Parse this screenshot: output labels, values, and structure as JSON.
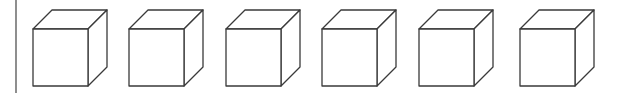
{
  "figure": {
    "divider": {
      "x": 16,
      "y1": 0,
      "y2": 93,
      "color": "#444444"
    },
    "stroke_color": "#3a3a3a",
    "cube_size": {
      "front_width": 55,
      "front_height": 57,
      "depth_dx": 19,
      "depth_dy": -19
    },
    "cubes": [
      {
        "id": 1,
        "front_x": 33,
        "front_y": 29
      },
      {
        "id": 2,
        "front_x": 129,
        "front_y": 29
      },
      {
        "id": 3,
        "front_x": 226,
        "front_y": 29
      },
      {
        "id": 4,
        "front_x": 322,
        "front_y": 29
      },
      {
        "id": 5,
        "front_x": 419,
        "front_y": 29
      },
      {
        "id": 6,
        "front_x": 520,
        "front_y": 29
      }
    ]
  }
}
